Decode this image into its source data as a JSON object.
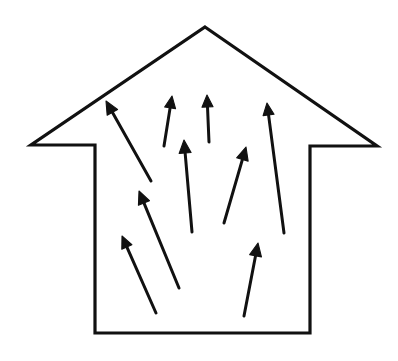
{
  "figure": {
    "description": "Line drawing of a house-shaped outline containing nine upward pointing arrows of varying lengths and tilts, suggesting rising air or heat inside the house.",
    "background_color": "#ffffff",
    "stroke_color": "#111111",
    "canvas": {
      "width": 398,
      "height": 361
    }
  },
  "house": {
    "name": "house-outline",
    "stroke_width": 3.2,
    "fill": "#ffffff",
    "points": "205,27 377,146 310,146 310,333 95,333 95,145 31,145",
    "vertices": [
      {
        "label": "roof-apex",
        "x": 205,
        "y": 27
      },
      {
        "label": "right-eave-tip",
        "x": 377,
        "y": 146
      },
      {
        "label": "right-eave-inner",
        "x": 310,
        "y": 146
      },
      {
        "label": "right-wall-bottom",
        "x": 310,
        "y": 333
      },
      {
        "label": "left-wall-bottom",
        "x": 95,
        "y": 333
      },
      {
        "label": "left-wall-top",
        "x": 95,
        "y": 145
      },
      {
        "label": "left-eave-tip",
        "x": 31,
        "y": 145
      }
    ]
  },
  "arrows": [
    {
      "name": "arrow-upper-left-long",
      "tail": {
        "x": 151,
        "y": 181
      },
      "tip": {
        "x": 106,
        "y": 101
      },
      "head_size": 13,
      "stroke_width": 3.0
    },
    {
      "name": "arrow-mid-left-diagonal",
      "tail": {
        "x": 179,
        "y": 288
      },
      "tip": {
        "x": 139,
        "y": 191
      },
      "head_size": 13,
      "stroke_width": 3.0
    },
    {
      "name": "arrow-lower-left-diagonal",
      "tail": {
        "x": 156,
        "y": 313
      },
      "tip": {
        "x": 122,
        "y": 236
      },
      "head_size": 12,
      "stroke_width": 3.0
    },
    {
      "name": "arrow-top-center-left",
      "tail": {
        "x": 164,
        "y": 146
      },
      "tip": {
        "x": 172,
        "y": 96
      },
      "head_size": 12,
      "stroke_width": 3.0
    },
    {
      "name": "arrow-top-center-vertical",
      "tail": {
        "x": 209,
        "y": 142
      },
      "tip": {
        "x": 207,
        "y": 95
      },
      "head_size": 12,
      "stroke_width": 3.0
    },
    {
      "name": "arrow-center-tall-vertical",
      "tail": {
        "x": 192,
        "y": 232
      },
      "tip": {
        "x": 184,
        "y": 140
      },
      "head_size": 13,
      "stroke_width": 3.2
    },
    {
      "name": "arrow-center-right-diagonal",
      "tail": {
        "x": 224,
        "y": 223
      },
      "tip": {
        "x": 246,
        "y": 147
      },
      "head_size": 13,
      "stroke_width": 3.0
    },
    {
      "name": "arrow-right-tall",
      "tail": {
        "x": 284,
        "y": 233
      },
      "tip": {
        "x": 267,
        "y": 103
      },
      "head_size": 12,
      "stroke_width": 3.0
    },
    {
      "name": "arrow-bottom-right-diagonal",
      "tail": {
        "x": 244,
        "y": 316
      },
      "tip": {
        "x": 258,
        "y": 243
      },
      "head_size": 13,
      "stroke_width": 3.0
    }
  ]
}
